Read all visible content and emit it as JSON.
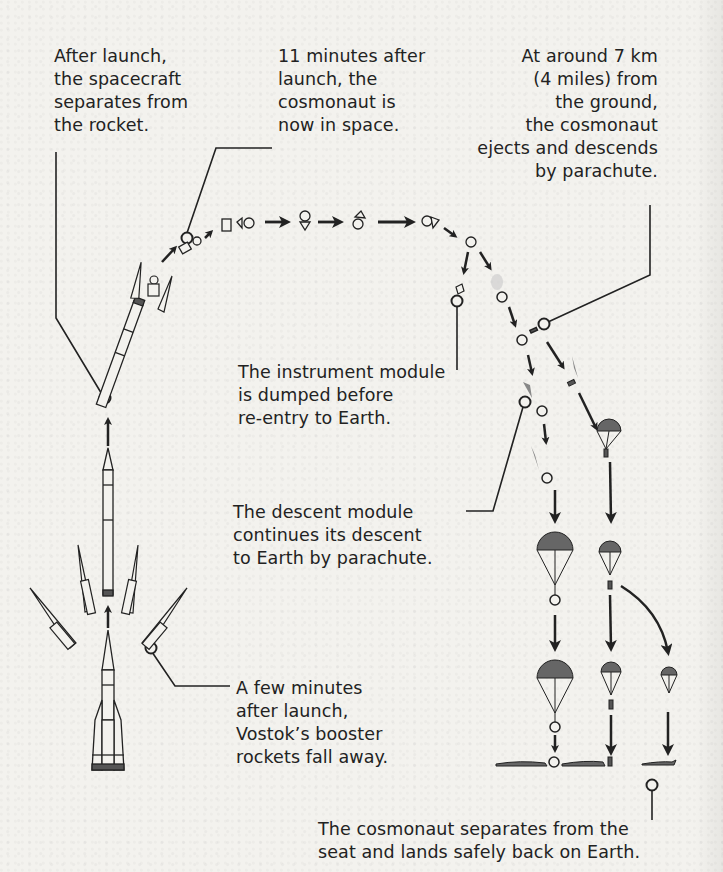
{
  "header": {
    "cut_off_text": "landing was so violent it could have split..."
  },
  "captions": {
    "separation": "After launch,\nthe spacecraft\nseparates from\nthe rocket.",
    "in_space": "11 minutes after\nlaunch, the\ncosmonaut is\nnow in space.",
    "ejection": "At around 7 km\n(4 miles) from\nthe ground,\nthe cosmonaut\nejects and descends\nby parachute.",
    "instrument_module": "The instrument module\nis dumped before\nre-entry to Earth.",
    "descent_module": "The descent module\ncontinues its descent\nto Earth by parachute.",
    "boosters": "A few minutes\nafter launch,\nVostok’s booster\nrockets fall away.",
    "landing": "The cosmonaut separates from the\nseat and lands safely back on Earth."
  },
  "colors": {
    "background": "#f3f2ee",
    "ink": "#222222",
    "canopy_fill": "#6b6b6b",
    "flame": "#8a8a8a"
  },
  "diagram": {
    "stages": [
      "launch",
      "booster-separation",
      "spacecraft-separation",
      "orbit",
      "instrument-module-jettison",
      "re-entry",
      "ejection",
      "parachute-descent",
      "landing"
    ]
  }
}
